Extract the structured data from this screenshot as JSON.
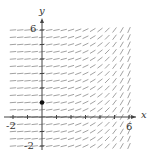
{
  "diagram": {
    "type": "slope_field",
    "axes": {
      "x_label": "x",
      "y_label": "y",
      "x_ticks_labeled": [
        "-2",
        "6"
      ],
      "y_ticks_labeled": [
        "6",
        "-2"
      ],
      "x_range": [
        -2,
        6
      ],
      "y_range": [
        -2,
        6
      ]
    },
    "point": {
      "x": 0,
      "y": 1
    },
    "colors": {
      "segments": "#8a8a8a",
      "axes": "#444444",
      "point": "#111111"
    }
  }
}
